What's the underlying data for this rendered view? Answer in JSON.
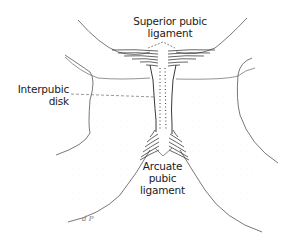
{
  "figure": {
    "labels": {
      "superior": [
        "Superior pubic",
        "ligament"
      ],
      "interpubic": [
        "Interpubic",
        "disk"
      ],
      "arcuate": [
        "Arcuate",
        "pubic",
        "ligament"
      ]
    },
    "signature": "d P",
    "colors": {
      "ink": "#222222",
      "outline": "#555555",
      "stipple": "#cfcfcf",
      "background": "#ffffff"
    }
  }
}
